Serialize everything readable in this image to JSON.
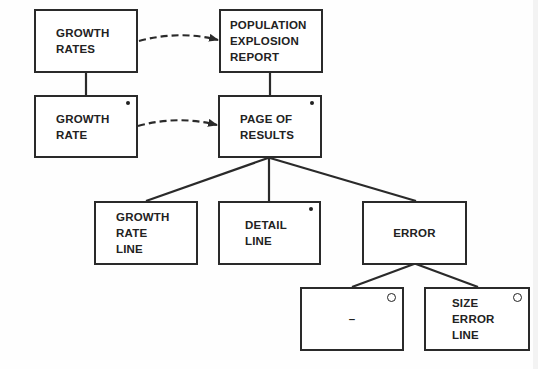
{
  "diagram": {
    "type": "jackson-structure-diagram",
    "nodes": [
      {
        "id": "growth_rates",
        "label": "GROWTH\nRATES",
        "marker": "none"
      },
      {
        "id": "population_explosion_report",
        "label": "POPULATION\nEXPLOSION\nREPORT",
        "marker": "none"
      },
      {
        "id": "growth_rate",
        "label": "GROWTH\nRATE",
        "marker": "iteration"
      },
      {
        "id": "page_of_results",
        "label": "PAGE OF\nRESULTS",
        "marker": "iteration"
      },
      {
        "id": "growth_rate_line",
        "label": "GROWTH\nRATE\nLINE",
        "marker": "none"
      },
      {
        "id": "detail_line",
        "label": "DETAIL\nLINE",
        "marker": "iteration"
      },
      {
        "id": "error",
        "label": "ERROR",
        "marker": "none"
      },
      {
        "id": "null_option",
        "label": "–",
        "marker": "selection"
      },
      {
        "id": "size_error_line",
        "label": "SIZE\nERROR\nLINE",
        "marker": "selection"
      }
    ],
    "edges": [
      {
        "from": "growth_rates",
        "to": "growth_rate",
        "style": "solid"
      },
      {
        "from": "population_explosion_report",
        "to": "page_of_results",
        "style": "solid"
      },
      {
        "from": "page_of_results",
        "to": "growth_rate_line",
        "style": "solid"
      },
      {
        "from": "page_of_results",
        "to": "detail_line",
        "style": "solid"
      },
      {
        "from": "page_of_results",
        "to": "error",
        "style": "solid"
      },
      {
        "from": "error",
        "to": "null_option",
        "style": "solid"
      },
      {
        "from": "error",
        "to": "size_error_line",
        "style": "solid"
      },
      {
        "from": "growth_rates",
        "to": "population_explosion_report",
        "style": "dashed-arrow"
      },
      {
        "from": "growth_rate",
        "to": "page_of_results",
        "style": "dashed-arrow"
      }
    ],
    "colors": {
      "line": "#2a2a2a",
      "background": "#fefefe"
    }
  }
}
